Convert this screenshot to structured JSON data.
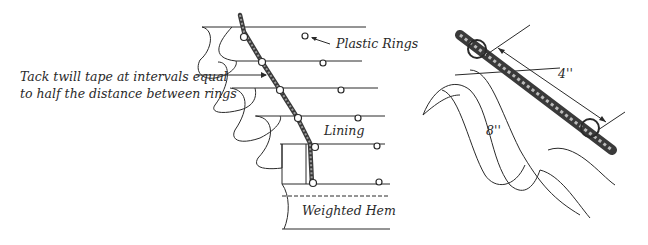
{
  "figure": {
    "left_panel": {
      "annotations": {
        "tack_line1": "Tack twill tape at intervals equal",
        "tack_line2": "to half the distance between rings",
        "plastic_rings": "Plastic Rings",
        "lining": "Lining",
        "weighted_hem": "Weighted Hem"
      }
    },
    "right_panel": {
      "dimensions": {
        "ring_spacing": "4''",
        "fold_depth": "8''"
      }
    },
    "colors": {
      "ink": "#2a2a2a",
      "background": "#ffffff"
    }
  }
}
